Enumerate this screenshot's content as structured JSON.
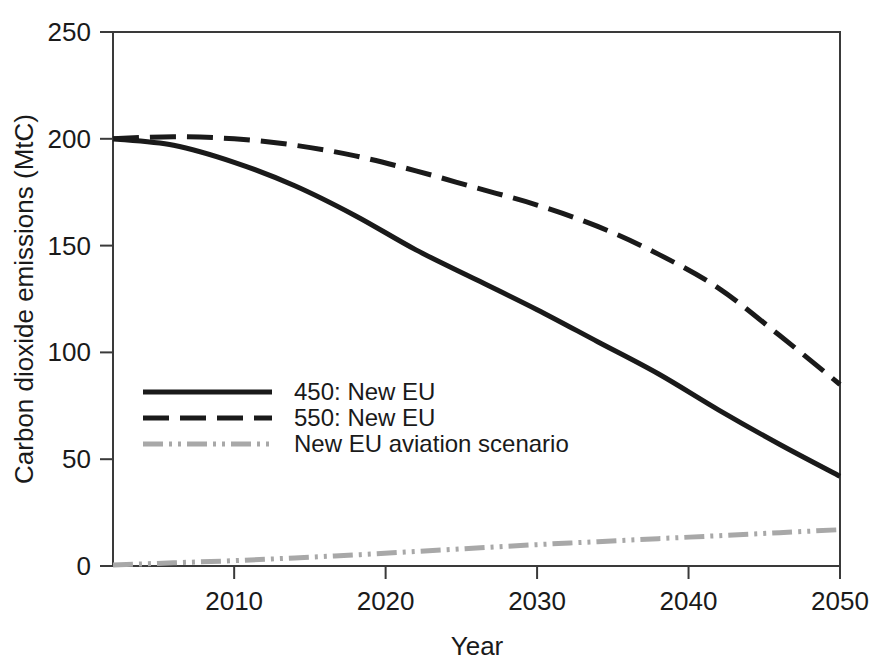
{
  "chart_data": {
    "type": "line",
    "title": "",
    "xlabel": "Year",
    "ylabel": "Carbon dioxide emissions (MtC)",
    "xlim": [
      2002,
      2050
    ],
    "ylim": [
      0,
      250
    ],
    "xticks": [
      2010,
      2020,
      2030,
      2040,
      2050
    ],
    "xtick_labels": [
      "2010",
      "2020",
      "2030",
      "2040",
      "2050"
    ],
    "yticks": [
      0,
      50,
      100,
      150,
      200,
      250
    ],
    "ytick_labels": [
      "0",
      "50",
      "100",
      "150",
      "200",
      "250"
    ],
    "grid": false,
    "legend_position": "inside-left-lower",
    "x": [
      2002,
      2006,
      2010,
      2014,
      2018,
      2022,
      2026,
      2030,
      2034,
      2038,
      2042,
      2046,
      2050
    ],
    "series": [
      {
        "name": "450: New EU",
        "style": "solid",
        "color": "#1a1a1a",
        "values": [
          200,
          197,
          189,
          178,
          164,
          148,
          134,
          120,
          105,
          90,
          73,
          57,
          42
        ]
      },
      {
        "name": "550: New EU",
        "style": "dashed",
        "color": "#1a1a1a",
        "values": [
          200,
          201,
          200,
          197,
          192,
          185,
          177,
          169,
          159,
          146,
          130,
          108,
          85
        ]
      },
      {
        "name": "New EU aviation scenario",
        "style": "dash-dot-dot",
        "color": "#a8a8a8",
        "values": [
          0.5,
          1.5,
          2.5,
          3.8,
          5.2,
          6.8,
          8.4,
          10.0,
          11.4,
          12.8,
          14.2,
          15.6,
          17.0
        ]
      }
    ]
  },
  "legend": {
    "entries": [
      {
        "label": "450: New EU"
      },
      {
        "label": "550: New EU"
      },
      {
        "label": "New EU aviation scenario"
      }
    ]
  },
  "axes": {
    "x_title": "Year",
    "y_title": "Carbon dioxide emissions (MtC)"
  }
}
